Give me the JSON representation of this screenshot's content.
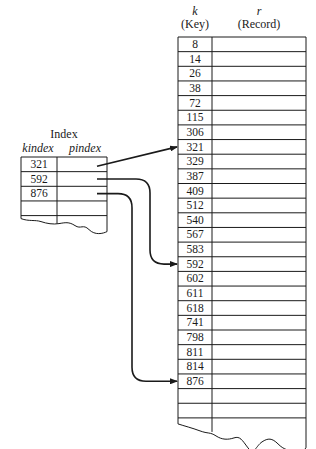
{
  "main_table": {
    "key_header_var": "k",
    "key_header_label": "(Key)",
    "record_header_var": "r",
    "record_header_label": "(Record)",
    "keys": [
      "8",
      "14",
      "26",
      "38",
      "72",
      "115",
      "306",
      "321",
      "329",
      "387",
      "409",
      "512",
      "540",
      "567",
      "583",
      "592",
      "602",
      "611",
      "618",
      "741",
      "798",
      "811",
      "814",
      "876"
    ],
    "empty_rows_after": 2
  },
  "index_table": {
    "title": "Index",
    "key_header": "kindex",
    "pointer_header": "pindex",
    "keys": [
      "321",
      "592",
      "876"
    ],
    "empty_rows_after": 1
  },
  "pointers": [
    {
      "from_index_key": "321",
      "to_key": "321"
    },
    {
      "from_index_key": "592",
      "to_key": "592"
    },
    {
      "from_index_key": "876",
      "to_key": "876"
    }
  ],
  "colors": {
    "ink": "#1a1a1a",
    "background": "#ffffff"
  }
}
